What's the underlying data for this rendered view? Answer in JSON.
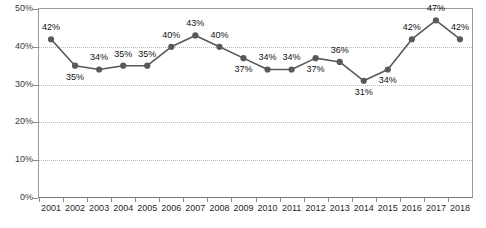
{
  "chart_data": {
    "type": "line",
    "title": "",
    "xlabel": "",
    "ylabel": "",
    "categories": [
      "2001",
      "2002",
      "2003",
      "2004",
      "2005",
      "2006",
      "2007",
      "2008",
      "2009",
      "2010",
      "2011",
      "2012",
      "2013",
      "2014",
      "2015",
      "2016",
      "2017",
      "2018"
    ],
    "values": [
      42,
      35,
      34,
      35,
      35,
      40,
      43,
      40,
      37,
      34,
      34,
      37,
      36,
      31,
      34,
      42,
      47,
      42
    ],
    "point_labels": [
      "42%",
      "35%",
      "34%",
      "35%",
      "35%",
      "40%",
      "43%",
      "40%",
      "37%",
      "34%",
      "34%",
      "37%",
      "36%",
      "31%",
      "34%",
      "42%",
      "47%",
      "42%"
    ],
    "label_positions": [
      "above",
      "below",
      "above",
      "above",
      "above",
      "above",
      "above",
      "above",
      "below",
      "above",
      "above",
      "below",
      "above",
      "below",
      "below",
      "above",
      "above",
      "above"
    ],
    "ylim": [
      0,
      50
    ],
    "ytick_values": [
      0,
      10,
      20,
      30,
      40,
      50
    ],
    "ytick_labels": [
      "0%",
      "10%",
      "20%",
      "30%",
      "40%",
      "50%"
    ],
    "grid": true,
    "grid_axis": "y",
    "legend": false,
    "legend_position": "none",
    "series_color": "#595959",
    "marker_color": "#595959",
    "gridline_color": "#b9b9b9",
    "axis_color": "#8a8a8a",
    "marker": "circle"
  }
}
